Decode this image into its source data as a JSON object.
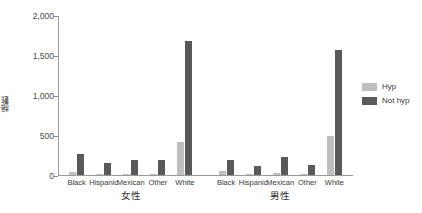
{
  "chart_data": {
    "type": "bar",
    "title": "",
    "subtitle": "",
    "xlabel": "",
    "ylabel": "頻數",
    "ylim": [
      0,
      2000
    ],
    "grid": false,
    "legend_position": "right",
    "yticks": [
      0,
      500,
      1000,
      1500,
      2000
    ],
    "ytick_labels": [
      "0",
      "500",
      "1,000",
      "1,500",
      "2,000"
    ],
    "groups": [
      {
        "label": "女性",
        "categories": [
          "Black",
          "Hispanic",
          "Mexican",
          "Other",
          "White"
        ]
      },
      {
        "label": "男性",
        "categories": [
          "Black",
          "Hispanic",
          "Mexican",
          "Other",
          "White"
        ]
      }
    ],
    "series": [
      {
        "name": "Hyp",
        "color": "#bfbfbf",
        "values": [
          55,
          20,
          25,
          20,
          430,
          60,
          25,
          35,
          25,
          500
        ]
      },
      {
        "name": "Not hyp",
        "color": "#595959",
        "values": [
          270,
          160,
          195,
          195,
          1690,
          200,
          120,
          240,
          140,
          1580
        ]
      }
    ],
    "categories_flat": [
      "Black",
      "Hispanic",
      "Mexican",
      "Other",
      "White",
      "Black",
      "Hispanic",
      "Mexican",
      "Other",
      "White"
    ]
  },
  "legend": {
    "items": [
      {
        "label": "Hyp",
        "color": "#bfbfbf"
      },
      {
        "label": "Not hyp",
        "color": "#595959"
      }
    ]
  },
  "colors": {
    "hyp": "#bfbfbf",
    "not_hyp": "#595959",
    "axis": "#9a9a9a",
    "text": "#3a3a3a",
    "background": "#ffffff"
  }
}
